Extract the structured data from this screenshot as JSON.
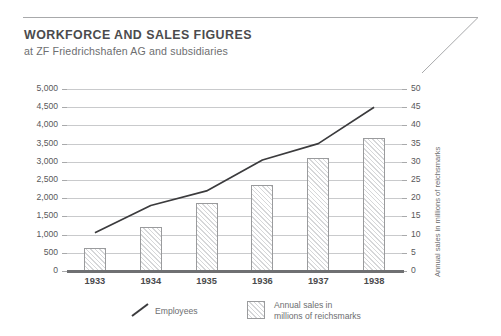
{
  "header": {
    "title": "WORKFORCE AND SALES FIGURES",
    "subtitle": "at ZF Friedrichshafen AG and subsidiaries"
  },
  "colors": {
    "title": "#4b4b4d",
    "text": "#6d6e70",
    "grid": "#c9cacc",
    "axis": "#6f7072",
    "line": "#3b3b3d",
    "bar_border": "#9a9b9d",
    "bar_fill": "#fbfbfb",
    "hatch": "#d6d7d9"
  },
  "legend": {
    "position": "bottom",
    "items": [
      {
        "marker": "diagonal-line",
        "label": "Employees"
      },
      {
        "marker": "hatched-square",
        "label_line1": "Annual sales in",
        "label_line2": "millions of reichsmarks"
      }
    ]
  },
  "chart_data": {
    "type": "bar",
    "title": "WORKFORCE AND SALES FIGURES",
    "subtitle": "at ZF Friedrichshafen AG and subsidiaries",
    "xlabel": "",
    "categories": [
      "1933",
      "1934",
      "1935",
      "1936",
      "1937",
      "1938"
    ],
    "grid": true,
    "series": [
      {
        "name": "Annual sales in millions of reichsmarks",
        "type": "bar",
        "axis": "right",
        "unit": "millions of reichsmarks",
        "values": [
          6.2,
          12.0,
          18.6,
          23.5,
          31.0,
          36.5
        ]
      },
      {
        "name": "Employees",
        "type": "line",
        "axis": "left",
        "unit": "employees",
        "values": [
          1050,
          1800,
          2200,
          3050,
          3500,
          4500
        ]
      }
    ],
    "axes": {
      "left": {
        "label": "Employees",
        "min": 0,
        "max": 5000,
        "step": 500,
        "ticks": [
          "0",
          "500",
          "1,000",
          "1,500",
          "2,000",
          "2,500",
          "3,000",
          "3,500",
          "4,000",
          "4,500",
          "5,000"
        ]
      },
      "right": {
        "label": "Annual sales in millions of reichsmarks",
        "min": 0,
        "max": 50,
        "step": 5,
        "ticks": [
          "0",
          "5",
          "10",
          "15",
          "20",
          "25",
          "30",
          "35",
          "40",
          "45",
          "50"
        ]
      }
    }
  }
}
